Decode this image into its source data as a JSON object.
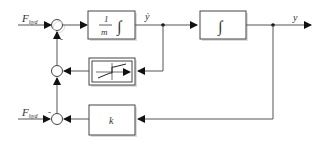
{
  "diagram": {
    "inputs": {
      "top": {
        "main": "F",
        "sub": "hyd"
      },
      "bottom": {
        "main": "F",
        "sub": "hyd"
      }
    },
    "signs": {
      "top_junction_bottom": "-",
      "bottom_junction_left": "-"
    },
    "blocks": {
      "mass_integrator": {
        "num": "1",
        "den": "m",
        "op": "∫"
      },
      "integrator": {
        "op": "∫"
      },
      "nonlinearity": {
        "type": "dead-zone / friction characteristic"
      },
      "gain": {
        "label": "k"
      }
    },
    "signals": {
      "velocity": "ẏ",
      "output": "y"
    },
    "colors": {
      "line": "#555555",
      "block_border": "#444444",
      "shadow": "#cccccc"
    }
  }
}
